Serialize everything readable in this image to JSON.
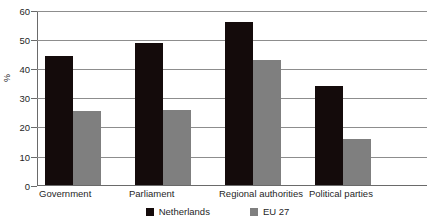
{
  "chart_data": {
    "type": "bar",
    "title": "",
    "xlabel": "",
    "ylabel": "%",
    "ylim": [
      0,
      60
    ],
    "yticks": [
      0,
      10,
      20,
      30,
      40,
      50,
      60
    ],
    "grid": true,
    "legend_position": "bottom",
    "categories": [
      "Government",
      "Parliament",
      "Regional authorities",
      "Political parties"
    ],
    "series": [
      {
        "name": "Netherlands",
        "color": "#140b0b",
        "values": [
          44.4,
          48.8,
          56.1,
          34.0
        ]
      },
      {
        "name": "EU 27",
        "color": "#7f7f7f",
        "values": [
          25.5,
          26.0,
          43.0,
          16.0
        ]
      }
    ]
  },
  "axis": {
    "y_title": "%",
    "tick_labels": [
      "60",
      "50",
      "40",
      "30",
      "20",
      "10",
      "0"
    ]
  },
  "legend": {
    "items": [
      {
        "label": "Netherlands"
      },
      {
        "label": "EU 27"
      }
    ]
  },
  "title_sliver": ""
}
